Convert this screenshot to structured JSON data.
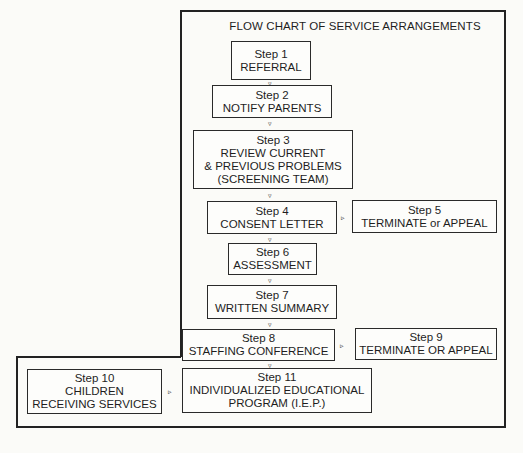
{
  "title": "FLOW CHART OF SERVICE ARRANGEMENTS",
  "steps": {
    "s1": {
      "step": "Step 1",
      "lines": [
        "REFERRAL"
      ]
    },
    "s2": {
      "step": "Step 2",
      "lines": [
        "NOTIFY PARENTS"
      ]
    },
    "s3": {
      "step": "Step 3",
      "lines": [
        "REVIEW CURRENT",
        "& PREVIOUS PROBLEMS",
        "(SCREENING TEAM)"
      ]
    },
    "s4": {
      "step": "Step 4",
      "lines": [
        "CONSENT LETTER"
      ]
    },
    "s5": {
      "step": "Step 5",
      "lines": [
        "TERMINATE or APPEAL"
      ]
    },
    "s6": {
      "step": "Step 6",
      "lines": [
        "ASSESSMENT"
      ]
    },
    "s7": {
      "step": "Step 7",
      "lines": [
        "WRITTEN SUMMARY"
      ]
    },
    "s8": {
      "step": "Step 8",
      "lines": [
        "STAFFING CONFERENCE"
      ]
    },
    "s9": {
      "step": "Step 9",
      "lines": [
        "TERMINATE OR APPEAL"
      ]
    },
    "s10": {
      "step": "Step 10",
      "lines": [
        "CHILDREN",
        "RECEIVING SERVICES"
      ]
    },
    "s11": {
      "step": "Step 11",
      "lines": [
        "INDIVIDUALIZED EDUCATIONAL",
        "PROGRAM (I.E.P.)"
      ]
    }
  },
  "arrows": {
    "down": "▿",
    "right": "▹"
  },
  "connections": [
    [
      "s1",
      "s2"
    ],
    [
      "s2",
      "s3"
    ],
    [
      "s3",
      "s4"
    ],
    [
      "s4",
      "s5"
    ],
    [
      "s4",
      "s6"
    ],
    [
      "s6",
      "s7"
    ],
    [
      "s7",
      "s8"
    ],
    [
      "s8",
      "s9"
    ],
    [
      "s8",
      "s11"
    ],
    [
      "s10",
      "s11"
    ]
  ]
}
